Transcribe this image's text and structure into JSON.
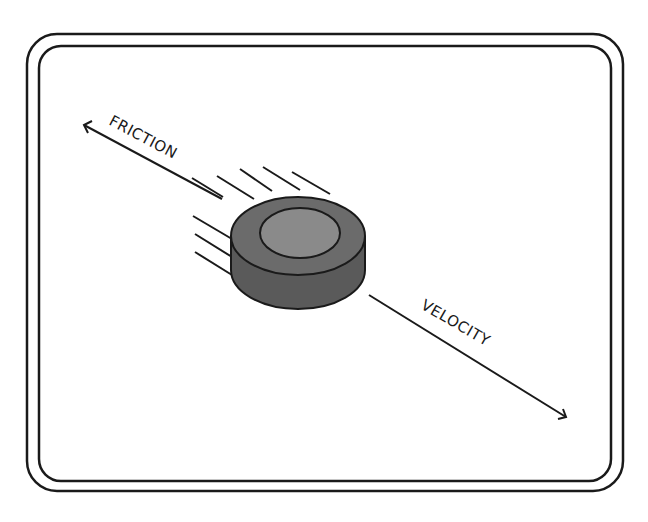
{
  "diagram": {
    "labels": {
      "friction": "FRICTION",
      "velocity": "VELOCITY"
    },
    "colors": {
      "stroke": "#1a1a1a",
      "puck_side": "#5a5a5a",
      "puck_top_ring": "#6b6b6b",
      "puck_top_center": "#8a8a8a",
      "background": "#ffffff"
    },
    "arrows": [
      {
        "name": "friction",
        "direction": "up-left"
      },
      {
        "name": "velocity",
        "direction": "down-right"
      }
    ],
    "object": "puck"
  }
}
